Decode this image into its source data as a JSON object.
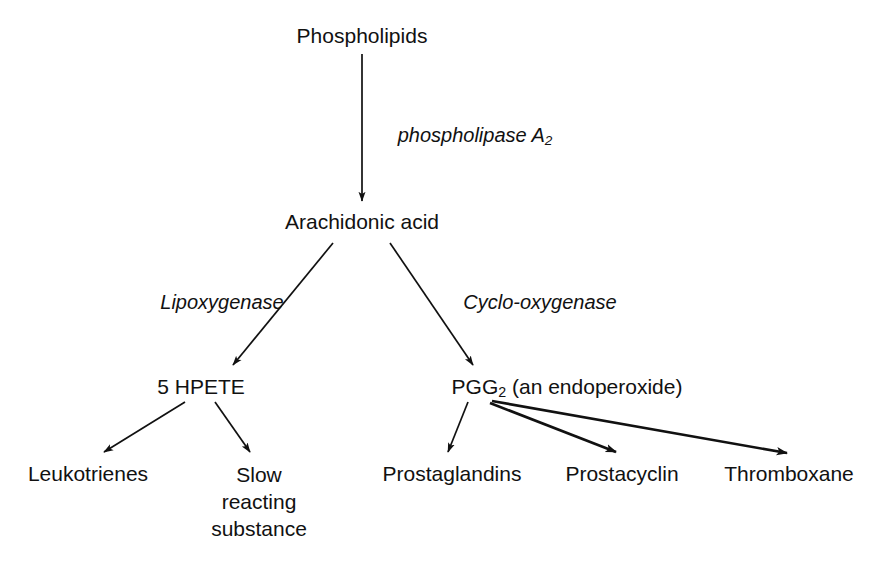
{
  "diagram": {
    "background_color": "#ffffff",
    "line_color": "#111111",
    "nodes": {
      "phospholipids": "Phospholipids",
      "arachidonic_acid": "Arachidonic acid",
      "hpete": "5 HPETE",
      "pgg2_main": "PGG",
      "pgg2_sub": "2",
      "pgg2_suffix": " (an endoperoxide)",
      "leukotrienes": "Leukotrienes",
      "slow_line1": "Slow",
      "slow_line2": "reacting",
      "slow_line3": "substance",
      "prostaglandins": "Prostaglandins",
      "prostacyclin": "Prostacyclin",
      "thromboxane": "Thromboxane"
    },
    "enzymes": {
      "phospholipase_main": "phospholipase A",
      "phospholipase_sub": "2",
      "lipoxygenase": "Lipoxygenase",
      "cyclo_oxygenase": "Cyclo-oxygenase"
    }
  }
}
